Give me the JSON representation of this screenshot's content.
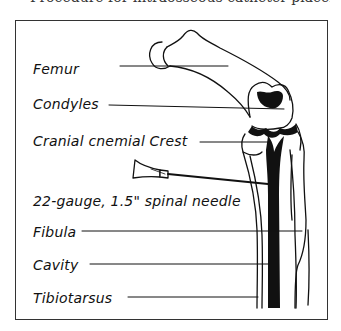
{
  "figure": {
    "top_caption_partial": "Procedure for intraosseous catheter placement",
    "labels": [
      {
        "id": "femur",
        "text": "Femur"
      },
      {
        "id": "condyles",
        "text": "Condyles"
      },
      {
        "id": "crest",
        "text": "Cranial cnemial Crest"
      },
      {
        "id": "needle",
        "text": "22-gauge, 1.5\" spinal needle"
      },
      {
        "id": "fibula",
        "text": "Fibula"
      },
      {
        "id": "cavity",
        "text": "Cavity"
      },
      {
        "id": "tibiotarsus",
        "text": "Tibiotarsus"
      }
    ],
    "colors": {
      "ink": "#111111",
      "frame": "#333333",
      "background": "#ffffff"
    }
  }
}
